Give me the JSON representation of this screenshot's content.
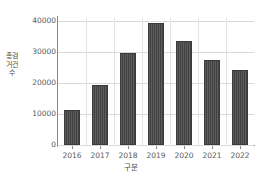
{
  "chart_data": {
    "type": "bar",
    "title": "",
    "subtitle": "",
    "xlabel": "구분",
    "ylabel": "총검거건수",
    "categories": [
      "2016",
      "2017",
      "2018",
      "2019",
      "2020",
      "2021",
      "2022"
    ],
    "values": [
      11300,
      19400,
      29800,
      39300,
      33700,
      27400,
      24200
    ],
    "series": [
      {
        "name": "총검거건수",
        "values": [
          11300,
          19400,
          29800,
          39300,
          33700,
          27400,
          24200
        ]
      }
    ],
    "ylim": [
      0,
      41000
    ],
    "yticks": [
      0,
      10000,
      20000,
      30000,
      40000
    ],
    "ytick_labels": [
      "0",
      "10000",
      "20000",
      "30000",
      "40000"
    ],
    "xtick_labels": [
      "2016",
      "2017",
      "2018",
      "2019",
      "2020",
      "2021",
      "2022"
    ],
    "grid": true,
    "legend": false,
    "legend_position": "none",
    "bar_color": "#4a4a4a",
    "grid_color": "#d9d9d9",
    "axis_color": "#8c8c8c",
    "background_color": "#ffffff"
  }
}
